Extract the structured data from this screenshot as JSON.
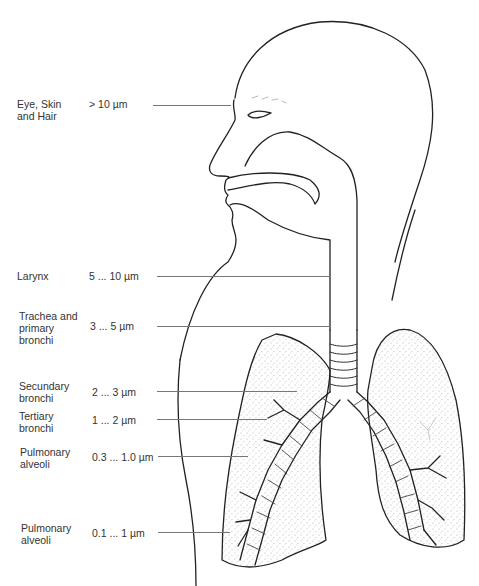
{
  "diagram": {
    "rows": [
      {
        "region": "Eye, Skin\nand Hair",
        "region_lines": [
          "Eye, Skin",
          "and Hair"
        ],
        "size": "> 10 µm"
      },
      {
        "region": "Larynx",
        "region_lines": [
          "Larynx"
        ],
        "size": "5 ... 10 µm"
      },
      {
        "region": "Trachea and primary bronchi",
        "region_lines": [
          "Trachea and",
          "primary",
          "bronchi"
        ],
        "size": "3 ... 5 µm"
      },
      {
        "region": "Secundary bronchi",
        "region_lines": [
          "Secundary",
          "bronchi"
        ],
        "size": "2 ... 3 µm"
      },
      {
        "region": "Tertiary bronchi",
        "region_lines": [
          "Tertiary",
          "bronchi"
        ],
        "size": "1 ... 2 µm"
      },
      {
        "region": "Pulmonary alveoli",
        "region_lines": [
          "Pulmonary",
          "alveoli"
        ],
        "size": "0.3 ... 1.0 µm"
      },
      {
        "region": "Pulmonary alveoli",
        "region_lines": [
          "Pulmonary",
          "alveoli"
        ],
        "size": "0.1 ... 1 µm"
      }
    ]
  }
}
